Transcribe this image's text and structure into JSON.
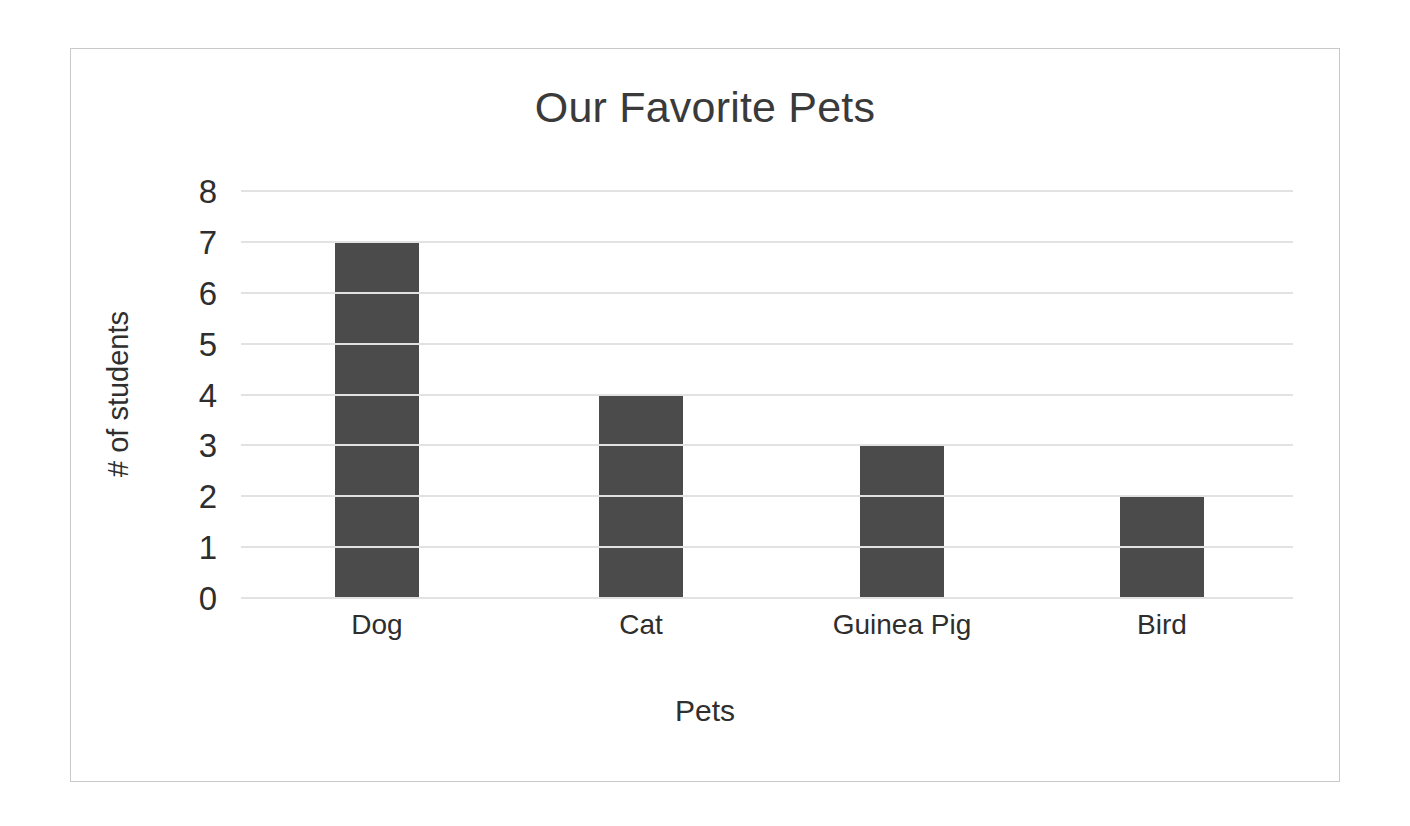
{
  "chart_data": {
    "type": "bar",
    "title": "Our Favorite Pets",
    "xlabel": "Pets",
    "ylabel": "# of students",
    "categories": [
      "Dog",
      "Cat",
      "Guinea Pig",
      "Bird"
    ],
    "values": [
      7,
      4,
      3,
      2
    ],
    "ylim": [
      0,
      8
    ],
    "ytick_labels": [
      "8",
      "7",
      "6",
      "5",
      "4",
      "3",
      "2",
      "1",
      "0"
    ],
    "ytick_values": [
      8,
      7,
      6,
      5,
      4,
      3,
      2,
      1,
      0
    ],
    "grid": true,
    "legend": false,
    "legend_position": "none",
    "bar_color": "#4b4b4b",
    "gridline_color": "#e2e2e2",
    "frame_border_color": "#c9c9c9",
    "background_color": "#ffffff",
    "text_color": "#2f2f2f"
  }
}
